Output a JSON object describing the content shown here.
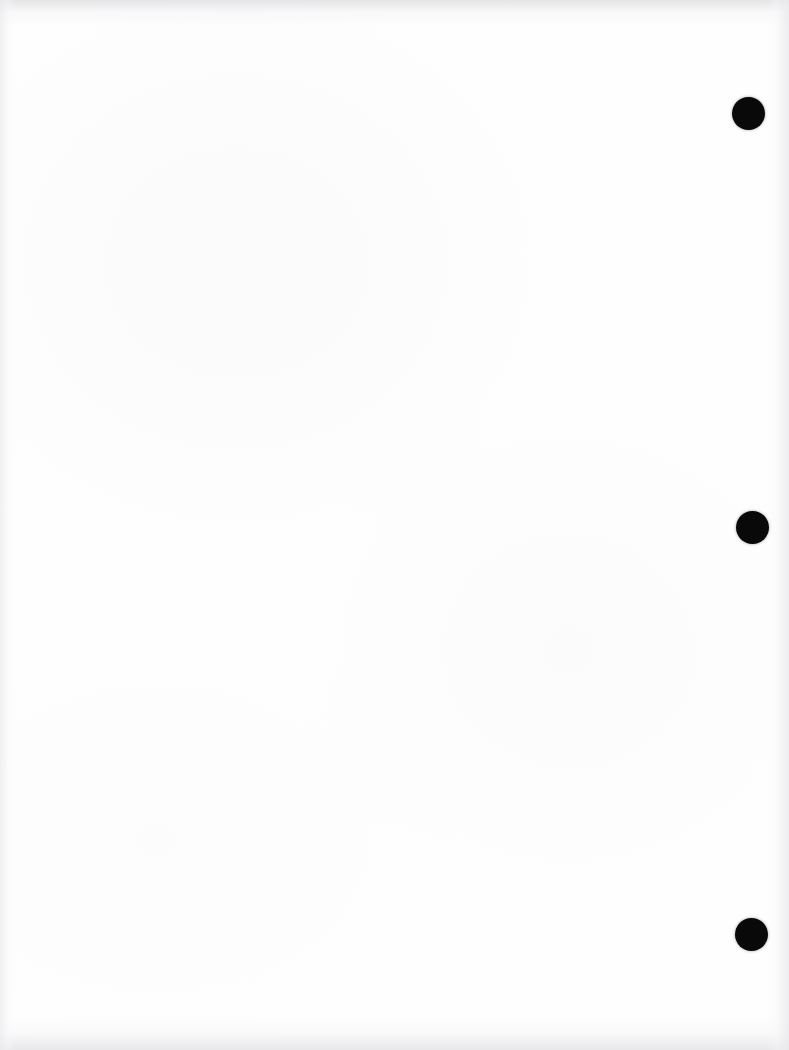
{
  "page": {
    "kind": "scanned-blank-page",
    "width": 789,
    "height": 1050,
    "background_color": "#ffffff",
    "paper_color": "#fefefe",
    "body_text": "",
    "visible_text": []
  },
  "marks": {
    "label": "registration-marks",
    "count": 3,
    "color": "#090909",
    "shape": "filled-circle",
    "items": [
      {
        "name": "registration-mark-top",
        "cx": 748,
        "cy": 113,
        "diameter": 33
      },
      {
        "name": "registration-mark-middle",
        "cx": 752,
        "cy": 527,
        "diameter": 33
      },
      {
        "name": "registration-mark-bottom",
        "cx": 751,
        "cy": 934,
        "diameter": 33
      }
    ]
  },
  "scan_artifacts": {
    "edge_shadow_color": "#e6e6e9",
    "edges": [
      "top",
      "right",
      "bottom",
      "left"
    ]
  }
}
